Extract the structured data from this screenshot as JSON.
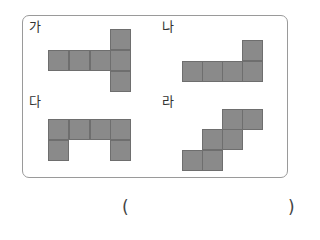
{
  "figures": [
    {
      "label": "가",
      "label_pos": [
        29,
        20
      ],
      "cells": [
        [
          48,
          50
        ],
        [
          69,
          50
        ],
        [
          90,
          50
        ],
        [
          110,
          29
        ],
        [
          110,
          50
        ],
        [
          110,
          71
        ]
      ]
    },
    {
      "label": "나",
      "label_pos": [
        162,
        20
      ],
      "cells": [
        [
          182,
          61
        ],
        [
          202,
          61
        ],
        [
          222,
          61
        ],
        [
          242,
          61
        ],
        [
          242,
          40
        ]
      ]
    },
    {
      "label": "다",
      "label_pos": [
        29,
        95
      ],
      "cells": [
        [
          48,
          119
        ],
        [
          69,
          119
        ],
        [
          90,
          119
        ],
        [
          110,
          119
        ],
        [
          48,
          140
        ],
        [
          110,
          140
        ]
      ]
    },
    {
      "label": "라",
      "label_pos": [
        162,
        95
      ],
      "cells": [
        [
          222,
          109
        ],
        [
          242,
          109
        ],
        [
          202,
          129
        ],
        [
          222,
          129
        ],
        [
          182,
          150
        ],
        [
          202,
          150
        ]
      ]
    }
  ],
  "answer": {
    "open_paren": "(",
    "close_paren": ")",
    "value": ""
  },
  "colors": {
    "cell_fill": "#8a8a8a",
    "cell_border": "#6e6e6e",
    "panel_border": "#9a9a9a"
  }
}
